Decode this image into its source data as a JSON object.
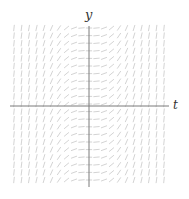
{
  "diagram": {
    "type": "slope-field",
    "equation_form": "dy/dt = f(t)",
    "axes": {
      "x_label": "t",
      "y_label": "y"
    },
    "colors": {
      "axis": "#7a7a7a",
      "segments": "#c8c8c8",
      "label": "#333333",
      "background": "#ffffff"
    },
    "grid": {
      "cols": 21,
      "rows": 21,
      "t_range": [
        -3,
        3
      ],
      "y_range": [
        -3,
        3
      ]
    }
  }
}
